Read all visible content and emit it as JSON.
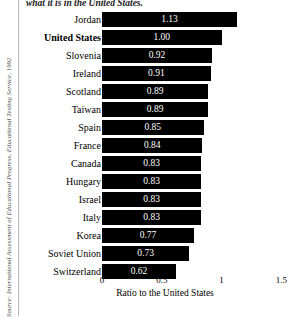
{
  "caption_fragment": "what it is in the United States.",
  "source_note": "Source: International Assessment of Educational Progress, Educational Testing Service, 1992",
  "chart_data": {
    "type": "bar",
    "orientation": "horizontal",
    "title": "",
    "xlabel": "Ratio to the United States",
    "ylabel": "",
    "xlim": [
      0,
      1.5
    ],
    "xticks": [
      0,
      0.5,
      1,
      1.5
    ],
    "xticklabels": [
      "0",
      "0.5",
      "1",
      "1.5"
    ],
    "grid": false,
    "legend": false,
    "bar_color": "#000000",
    "value_label_color": "#ffffff",
    "highlight_category": "United States",
    "categories": [
      "Jordan",
      "United States",
      "Slovenia",
      "Ireland",
      "Scotland",
      "Taiwan",
      "Spain",
      "France",
      "Canada",
      "Hungary",
      "Israel",
      "Italy",
      "Korea",
      "Soviet Union",
      "Switzerland"
    ],
    "values": [
      1.13,
      1.0,
      0.92,
      0.91,
      0.89,
      0.89,
      0.85,
      0.84,
      0.83,
      0.83,
      0.83,
      0.83,
      0.77,
      0.73,
      0.62
    ],
    "value_labels": [
      "1.13",
      "1.00",
      "0.92",
      "0.91",
      "0.89",
      "0.89",
      "0.85",
      "0.84",
      "0.83",
      "0.83",
      "0.83",
      "0.83",
      "0.77",
      "0.73",
      "0.62"
    ]
  }
}
